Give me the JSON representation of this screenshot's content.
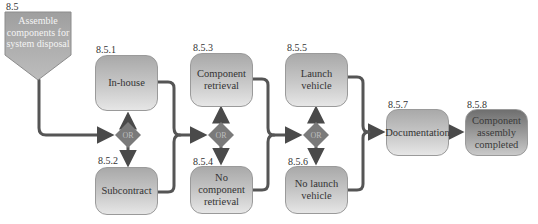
{
  "diagram": {
    "root": {
      "id": "8.5",
      "label": "Assemble components for system disposal"
    },
    "nodes": [
      {
        "id": "8.5.1",
        "label": "In-house"
      },
      {
        "id": "8.5.2",
        "label": "Subcontract"
      },
      {
        "id": "8.5.3",
        "label": "Component retrieval"
      },
      {
        "id": "8.5.4",
        "label": "No component retrieval"
      },
      {
        "id": "8.5.5",
        "label": "Launch vehicle"
      },
      {
        "id": "8.5.6",
        "label": "No launch vehicle"
      },
      {
        "id": "8.5.7",
        "label": "Documentation"
      },
      {
        "id": "8.5.8",
        "label": "Component assembly completed"
      }
    ],
    "gates": [
      {
        "label": "OR"
      },
      {
        "label": "OR"
      },
      {
        "label": "OR"
      }
    ],
    "colors": {
      "connector": "#555555",
      "node_fill": "#c8c8c8",
      "gate_fill": "#7a7a7a",
      "root_fill": "#a8a8a8"
    }
  }
}
